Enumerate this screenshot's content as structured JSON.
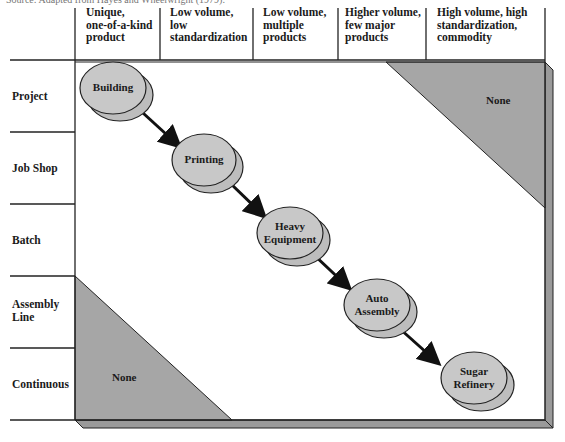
{
  "source_note": "Source: Adapted from Hayes and Wheelwright (1979).",
  "columns": [
    {
      "label": "Unique, one-of-a-kind product",
      "lines": [
        "Unique,",
        "one-of-a-kind",
        "product"
      ]
    },
    {
      "label": "Low volume, low standardization",
      "lines": [
        "Low volume,",
        "low",
        "standardization"
      ]
    },
    {
      "label": "Low volume, multiple products",
      "lines": [
        "Low volume,",
        "multiple",
        "products"
      ]
    },
    {
      "label": "Higher volume, few major products",
      "lines": [
        "Higher volume,",
        "few major",
        "products"
      ]
    },
    {
      "label": "High volume, high standardization, commodity",
      "lines": [
        "High volume, high",
        "standardization,",
        "commodity"
      ]
    }
  ],
  "rows": [
    {
      "label": "Project",
      "lines": [
        "Project"
      ]
    },
    {
      "label": "Job Shop",
      "lines": [
        "Job Shop"
      ]
    },
    {
      "label": "Batch",
      "lines": [
        "Batch"
      ]
    },
    {
      "label": "Assembly Line",
      "lines": [
        "Assembly",
        "Line"
      ]
    },
    {
      "label": "Continuous",
      "lines": [
        "Continuous"
      ]
    }
  ],
  "nodes": [
    {
      "label": "Building",
      "lines": [
        "Building"
      ],
      "row": "Project",
      "column": "Unique, one-of-a-kind product"
    },
    {
      "label": "Printing",
      "lines": [
        "Printing"
      ],
      "row": "Job Shop",
      "column": "Low volume, low standardization"
    },
    {
      "label": "Heavy Equipment",
      "lines": [
        "Heavy",
        "Equipment"
      ],
      "row": "Batch",
      "column": "Low volume, multiple products"
    },
    {
      "label": "Auto Assembly",
      "lines": [
        "Auto",
        "Assembly"
      ],
      "row": "Assembly Line",
      "column": "Higher volume, few major products"
    },
    {
      "label": "Sugar Refinery",
      "lines": [
        "Sugar",
        "Refinery"
      ],
      "row": "Continuous",
      "column": "High volume, high standardization, commodity"
    }
  ],
  "edges": [
    {
      "from": "Building",
      "to": "Printing"
    },
    {
      "from": "Printing",
      "to": "Heavy Equipment"
    },
    {
      "from": "Heavy Equipment",
      "to": "Auto Assembly"
    },
    {
      "from": "Auto Assembly",
      "to": "Sugar Refinery"
    }
  ],
  "regions": [
    {
      "label": "None",
      "position": "top-right"
    },
    {
      "label": "None",
      "position": "bottom-left"
    }
  ],
  "colors": {
    "node_fill": "#c8c8c8",
    "node_shadow": "#bdbdbd",
    "region_fill": "#a6a6a6",
    "frame_shade": "#9a9a9a",
    "line": "#1a1a1a"
  }
}
